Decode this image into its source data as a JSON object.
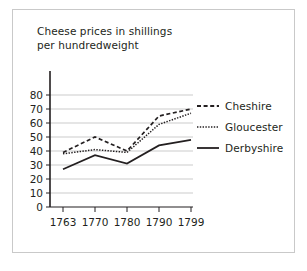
{
  "figure": {
    "background_color": "#ffffff",
    "border_color": "#c9c9c9",
    "text_color": "#231f20"
  },
  "title_line1": "Cheese prices in shillings",
  "title_line2": "per hundredweight",
  "title_full": "Cheese prices in shillings\nper hundredweight",
  "legend": {
    "position": "right",
    "entries": [
      {
        "label": "Cheshire",
        "style": "dashed",
        "swatch_name": "dashed-line-swatch"
      },
      {
        "label": "Gloucester",
        "style": "dotted",
        "swatch_name": "dotted-line-swatch"
      },
      {
        "label": "Derbyshire",
        "style": "solid",
        "swatch_name": "solid-line-swatch"
      }
    ]
  },
  "axis": {
    "y_ticks": [
      "80",
      "70",
      "60",
      "50",
      "40",
      "30",
      "20",
      "10",
      "0"
    ],
    "x_ticks": [
      "1763",
      "1770",
      "1780",
      "1790",
      "1799"
    ]
  },
  "chart_data": {
    "type": "line",
    "title": "Cheese prices in shillings per hundredweight",
    "xlabel": "",
    "ylabel": "",
    "categories": [
      "1763",
      "1770",
      "1780",
      "1790",
      "1799"
    ],
    "x": [
      1763,
      1770,
      1780,
      1790,
      1799
    ],
    "series": [
      {
        "name": "Cheshire",
        "style": "dashed",
        "color": "#231f20",
        "values": [
          39,
          50,
          40,
          65,
          70
        ]
      },
      {
        "name": "Gloucester",
        "style": "dotted",
        "color": "#231f20",
        "values": [
          38,
          41,
          39,
          59,
          67
        ]
      },
      {
        "name": "Derbyshire",
        "style": "solid",
        "color": "#231f20",
        "values": [
          27,
          37,
          31,
          44,
          48
        ]
      }
    ],
    "ylim": [
      0,
      85
    ],
    "yticks": [
      0,
      10,
      20,
      30,
      40,
      50,
      60,
      70,
      80
    ],
    "grid": true,
    "grid_axis": "y",
    "legend_position": "right"
  }
}
